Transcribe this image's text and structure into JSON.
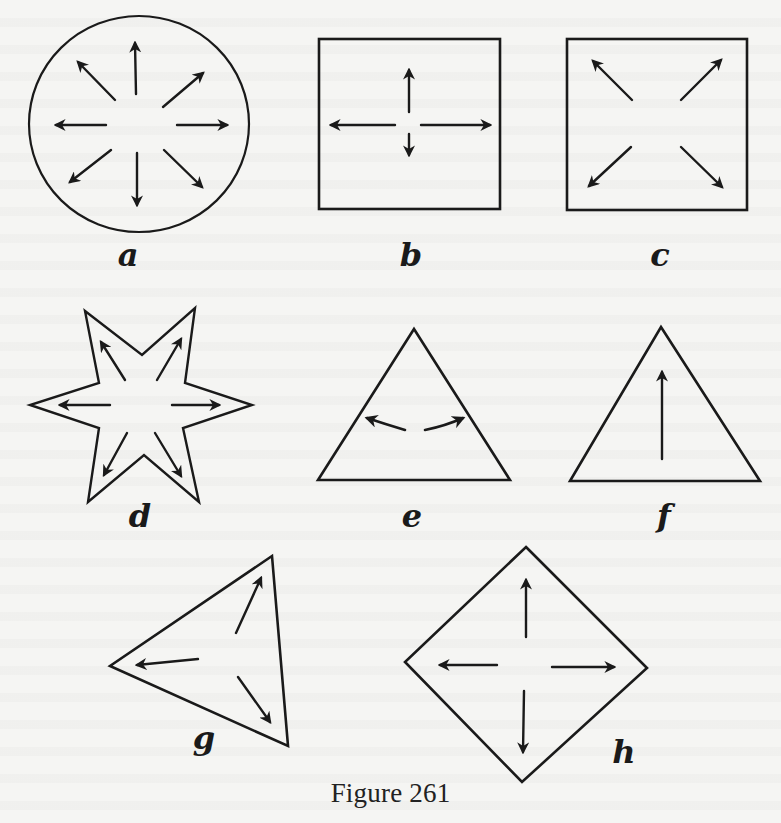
{
  "figure": {
    "caption": "Figure 261",
    "stroke_color": "#1a1a1a",
    "background_color": "#f5f5f3",
    "panels": [
      {
        "id": "a",
        "label": "a",
        "shape": "circle",
        "arrows": 8,
        "description": "Circle with eight arrows radiating outward in all directions"
      },
      {
        "id": "b",
        "label": "b",
        "shape": "square",
        "arrows": 4,
        "description": "Square with four orthogonal arrows (up, down, left, right); down arrow shorter"
      },
      {
        "id": "c",
        "label": "c",
        "shape": "square",
        "arrows": 4,
        "description": "Square with four diagonal arrows pointing to corners"
      },
      {
        "id": "d",
        "label": "d",
        "shape": "six-pointed star",
        "arrows": 6,
        "description": "Six-pointed star with six arrows pointing to each point"
      },
      {
        "id": "e",
        "label": "e",
        "shape": "triangle",
        "arrows": 2,
        "description": "Triangle with two curved arrows pointing toward left and right sides"
      },
      {
        "id": "f",
        "label": "f",
        "shape": "triangle",
        "arrows": 1,
        "description": "Triangle with one long arrow pointing up toward the apex"
      },
      {
        "id": "g",
        "label": "g",
        "shape": "tilted triangle",
        "arrows": 3,
        "description": "Rotated triangle with three arrows pointing to its vertices"
      },
      {
        "id": "h",
        "label": "h",
        "shape": "diamond",
        "arrows": 4,
        "description": "Diamond (rhombus) with four arrows pointing to each vertex"
      }
    ]
  }
}
